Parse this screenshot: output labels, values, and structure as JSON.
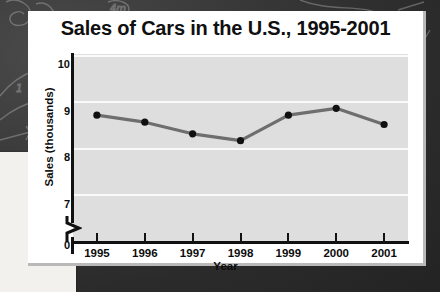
{
  "background": {
    "kind": "chalkboard",
    "color": "#333333",
    "chalk_color": "#c9c9c9"
  },
  "card": {
    "background": "#ffffff",
    "border_color": "#b9b9b9"
  },
  "chart_data": {
    "type": "line",
    "title": "Sales of Cars in the U.S., 1995-2001",
    "xlabel": "Year",
    "ylabel": "Sales (thousands)",
    "categories": [
      "1995",
      "1996",
      "1997",
      "1998",
      "1999",
      "2000",
      "2001"
    ],
    "values": [
      8.7,
      8.55,
      8.3,
      8.15,
      8.7,
      8.85,
      8.5
    ],
    "series": [
      {
        "name": "Sales",
        "values": [
          8.7,
          8.55,
          8.3,
          8.15,
          8.7,
          8.85,
          8.5
        ]
      }
    ],
    "ylim": [
      6.8,
      10.2
    ],
    "ytick_labels": [
      "10",
      "9",
      "8",
      "7",
      "0"
    ],
    "ytick_values": [
      10,
      9,
      8,
      7,
      0
    ],
    "y_axis_broken": true,
    "y_axis_break_between": [
      0,
      7
    ],
    "xtick_labels": [
      "1995",
      "1996",
      "1997",
      "1998",
      "1999",
      "2000",
      "2001"
    ],
    "grid": true,
    "grid_color": "#fafafa",
    "legend": false,
    "plot_background": "#dedede",
    "line_color": "#6e6e6e",
    "marker_color": "#101010",
    "axis_color": "#111111"
  }
}
